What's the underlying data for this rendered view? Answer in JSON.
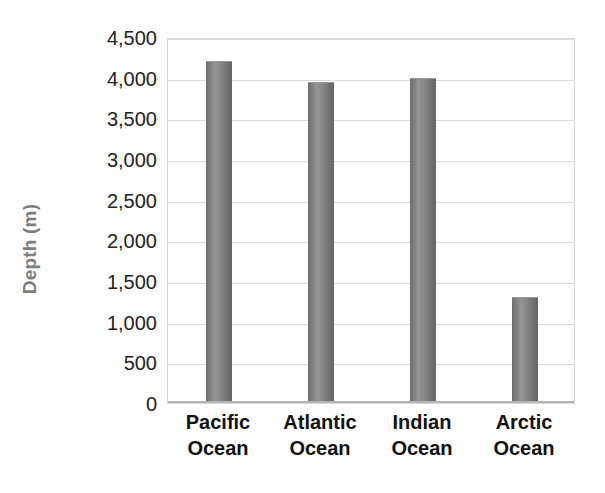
{
  "chart_data": {
    "type": "bar",
    "title": "",
    "subtitle": "",
    "xlabel": "",
    "ylabel": "Depth (m)",
    "categories": [
      "Pacific Ocean",
      "Atlantic Ocean",
      "Indian Ocean",
      "Arctic Ocean"
    ],
    "category_lines": [
      [
        "Pacific",
        "Ocean"
      ],
      [
        "Atlantic",
        "Ocean"
      ],
      [
        "Indian",
        "Ocean"
      ],
      [
        "Arctic",
        "Ocean"
      ]
    ],
    "values": [
      4200,
      3950,
      3990,
      1300
    ],
    "ylim": [
      0,
      4500
    ],
    "ytick_step": 500,
    "ytick_labels": [
      "4,500",
      "4,000",
      "3,500",
      "3,000",
      "2,500",
      "2,000",
      "1,500",
      "1,000",
      "500",
      "0"
    ],
    "ytick_values": [
      4500,
      4000,
      3500,
      3000,
      2500,
      2000,
      1500,
      1000,
      500,
      0
    ],
    "grid": true,
    "grid_axis": "y",
    "legend": false,
    "legend_position": "none",
    "bar_style": "cylinder",
    "colors": {
      "bar_dark": "#6e6e6e",
      "bar_light": "#949494",
      "gridline": "#dcdcdc",
      "plot_border": "#d8d8d8",
      "axis_line": "#b4b4b4",
      "tick_text": "#232323",
      "axis_title_text": "#7e7e7e",
      "category_text": "#111111",
      "background": "#fdfdfd",
      "plot_background": "#ffffff"
    }
  }
}
